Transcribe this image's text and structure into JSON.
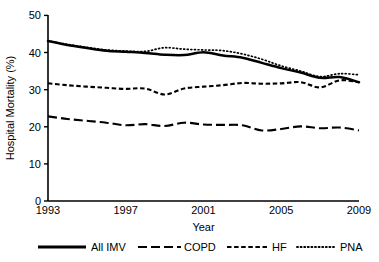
{
  "chart_data": {
    "type": "line",
    "title": "",
    "xlabel": "Year",
    "ylabel": "Hospital Mortality (%)",
    "xlim": [
      1993,
      2009
    ],
    "ylim": [
      0,
      50
    ],
    "xticks": [
      1993,
      1997,
      2001,
      2005,
      2009
    ],
    "yticks": [
      0,
      10,
      20,
      30,
      40,
      50
    ],
    "grid": false,
    "legend_position": "bottom",
    "x": [
      1993,
      1994,
      1995,
      1996,
      1997,
      1998,
      1999,
      2000,
      2001,
      2002,
      2003,
      2004,
      2005,
      2006,
      2007,
      2008,
      2009
    ],
    "series": [
      {
        "name": "All IMV",
        "style": "solid",
        "values": [
          43.1,
          42.0,
          41.2,
          40.5,
          40.2,
          39.9,
          39.4,
          39.3,
          40.1,
          39.2,
          38.6,
          37.2,
          35.8,
          34.6,
          33.2,
          33.4,
          32.0
        ]
      },
      {
        "name": "COPD",
        "style": "long-dash",
        "values": [
          22.8,
          22.1,
          21.6,
          21.1,
          20.4,
          20.7,
          20.2,
          21.1,
          20.6,
          20.5,
          20.4,
          19.0,
          19.4,
          20.1,
          19.6,
          19.8,
          19.0
        ]
      },
      {
        "name": "HF",
        "style": "short-dash",
        "values": [
          31.7,
          31.2,
          30.8,
          30.5,
          30.2,
          30.3,
          28.7,
          30.3,
          30.8,
          31.2,
          31.8,
          31.6,
          31.7,
          32.0,
          30.6,
          32.5,
          32.0
        ]
      },
      {
        "name": "PNA",
        "style": "dotted",
        "values": [
          43.1,
          42.2,
          41.4,
          40.7,
          40.4,
          40.3,
          41.3,
          40.9,
          40.7,
          40.5,
          39.6,
          38.2,
          36.4,
          35.0,
          33.5,
          34.3,
          34.0
        ]
      }
    ]
  },
  "axes": {
    "y_label": "Hospital Mortality (%)",
    "x_label": "Year",
    "y_tick_labels": [
      "50",
      "40",
      "30",
      "20",
      "10",
      "0"
    ],
    "x_tick_labels": [
      "1993",
      "1997",
      "2001",
      "2005",
      "2009"
    ]
  },
  "legend": {
    "items": [
      {
        "label": "All IMV",
        "style": "solid"
      },
      {
        "label": "COPD",
        "style": "long-dash"
      },
      {
        "label": "HF",
        "style": "short-dash"
      },
      {
        "label": "PNA",
        "style": "dotted"
      }
    ]
  }
}
